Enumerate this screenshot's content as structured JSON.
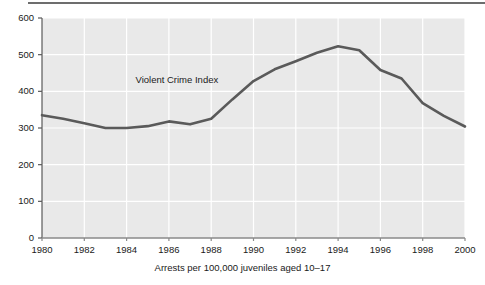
{
  "figure": {
    "caption": "Arrests per 100,000 juveniles aged 10–17",
    "series_label": "Violent Crime Index",
    "line_color": "#5a5a5a",
    "plot_background": "#e9e9e9",
    "gridline_color": "#ffffff",
    "axis_color": "#5a5a5a",
    "text_color": "#1a1a1a"
  },
  "chart_data": {
    "type": "line",
    "title": "",
    "subtitle": "",
    "xlabel": "Arrests per 100,000 juveniles aged 10–17",
    "ylabel": "",
    "xlim": [
      1980,
      2000
    ],
    "ylim": [
      0,
      600
    ],
    "grid": true,
    "legend": "inline annotation",
    "annotations": [
      {
        "text": "Violent Crime Index",
        "x": 1986.5,
        "y": 430
      }
    ],
    "xticks": [
      1980,
      1982,
      1984,
      1986,
      1988,
      1990,
      1992,
      1994,
      1996,
      1998,
      2000
    ],
    "xtick_labels": [
      "1980",
      "1982",
      "1984",
      "1986",
      "1988",
      "1990",
      "1992",
      "1994",
      "1996",
      "1998",
      "2000"
    ],
    "yticks": [
      0,
      100,
      200,
      300,
      400,
      500,
      600
    ],
    "ytick_labels": [
      "0",
      "100",
      "200",
      "300",
      "400",
      "500",
      "600"
    ],
    "series": [
      {
        "name": "Violent Crime Index",
        "x": [
          1980,
          1981,
          1982,
          1983,
          1984,
          1985,
          1986,
          1987,
          1988,
          1989,
          1990,
          1991,
          1992,
          1993,
          1994,
          1995,
          1996,
          1997,
          1998,
          1999,
          2000
        ],
        "values": [
          335,
          325,
          313,
          300,
          300,
          305,
          318,
          310,
          325,
          378,
          428,
          460,
          482,
          505,
          523,
          512,
          458,
          435,
          368,
          333,
          304
        ]
      }
    ]
  }
}
